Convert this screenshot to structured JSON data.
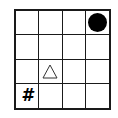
{
  "grid": {
    "rows": 4,
    "cols": 4,
    "cells": [
      {
        "row": 0,
        "col": 3,
        "symbol": "filled-circle",
        "text": ""
      },
      {
        "row": 2,
        "col": 1,
        "symbol": "triangle-outline",
        "text": ""
      },
      {
        "row": 3,
        "col": 0,
        "symbol": "hash",
        "text": "#"
      }
    ]
  },
  "colors": {
    "line": "#1a1a1a",
    "symbol": "#000000",
    "background": "#ffffff"
  }
}
